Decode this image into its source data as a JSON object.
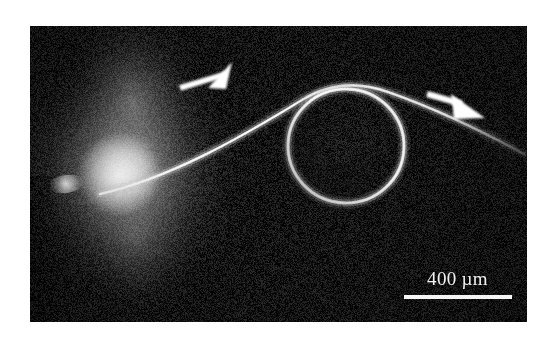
{
  "figure": {
    "type": "grayscale-micrograph",
    "background_color": "#ffffff",
    "image_area": {
      "x": 30,
      "y": 26,
      "width": 497,
      "height": 296,
      "background_color": "#151515"
    }
  },
  "scalebar": {
    "label": "400 µm",
    "value": 400,
    "unit": "µm",
    "bar_length_px": 108,
    "color": "#f5f5f5"
  },
  "annotations": {
    "arrows": [
      {
        "name": "arrow-left",
        "label": "",
        "direction": "up-right",
        "tip_x": 232,
        "tip_y": 72,
        "color": "#ffffff"
      },
      {
        "name": "arrow-right",
        "label": "",
        "direction": "down-right",
        "tip_x": 497,
        "tip_y": 112,
        "color": "#ffffff"
      }
    ]
  },
  "features": {
    "glow": {
      "name": "bright-diffuse-glow",
      "center_x": 95,
      "center_y": 145,
      "color": "#fafafa"
    },
    "ring": {
      "name": "bright-circular-loop",
      "center_x": 316,
      "center_y": 120,
      "radius_x": 58,
      "radius_y": 57,
      "color": "#f0f0f0"
    },
    "filament": {
      "name": "bright-curved-filament",
      "color": "#e8e8e8"
    }
  }
}
